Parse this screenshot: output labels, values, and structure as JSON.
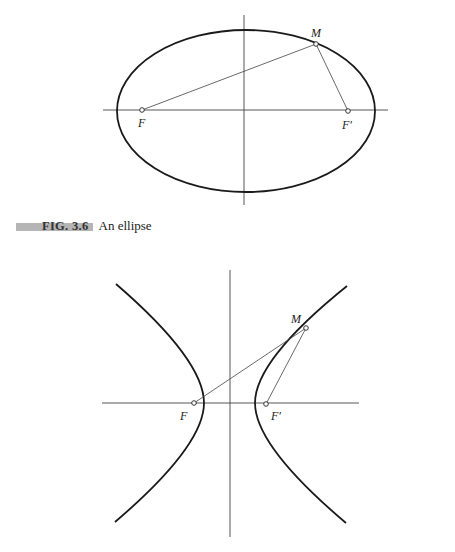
{
  "figure_ellipse": {
    "caption_number": "FIG. 3.6",
    "caption_text": "An ellipse",
    "labels": {
      "M": "M",
      "F": "F",
      "F_prime": "F′"
    },
    "points": {
      "F": [
        142,
        110
      ],
      "F_prime": [
        348,
        111
      ],
      "M": [
        316,
        44
      ]
    },
    "ellipse": {
      "cx": 246,
      "cy": 111,
      "rx": 129,
      "ry": 81
    },
    "axes": {
      "x_axis": [
        103,
        388,
        110
      ],
      "y_axis": [
        244,
        15,
        205
      ]
    }
  },
  "figure_hyperbola": {
    "labels": {
      "M": "M",
      "F": "F",
      "F_prime": "F′"
    },
    "points": {
      "F": [
        194,
        403
      ],
      "F_prime": [
        266,
        404
      ],
      "M": [
        306,
        328
      ]
    },
    "axes": {
      "x_axis": [
        102,
        359,
        403
      ],
      "y_axis": [
        230,
        270,
        537
      ]
    }
  }
}
